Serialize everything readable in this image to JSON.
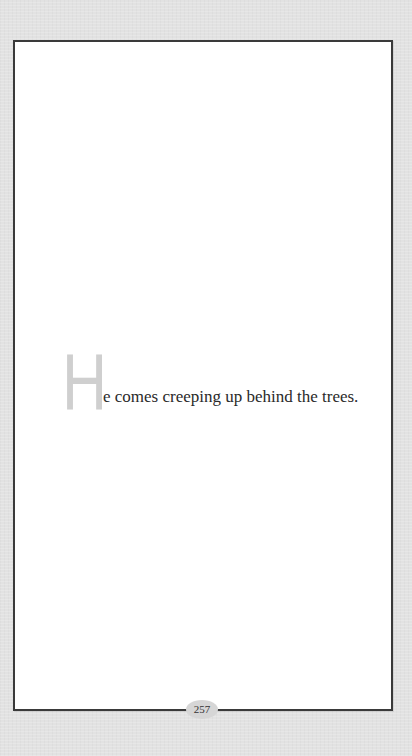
{
  "page": {
    "drop_cap": "H",
    "text_rest": "e comes creeping up behind the trees.",
    "page_number": "257"
  },
  "colors": {
    "background": "#e2e2e2",
    "page": "#ffffff",
    "border": "#3a3a3a",
    "drop_cap": "#cfcfcf",
    "text": "#2a2a2a",
    "page_number_badge": "#d6d6d6"
  }
}
